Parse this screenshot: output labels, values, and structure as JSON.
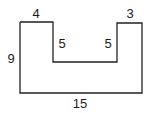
{
  "diagram": {
    "shape": "U-shaped polygon (rectilinear)",
    "stroke_color": "#222222",
    "labels": {
      "left_top_width": "4",
      "right_top_width": "3",
      "left_notch_depth": "5",
      "right_notch_depth": "5",
      "height": "9",
      "bottom_width": "15"
    }
  }
}
